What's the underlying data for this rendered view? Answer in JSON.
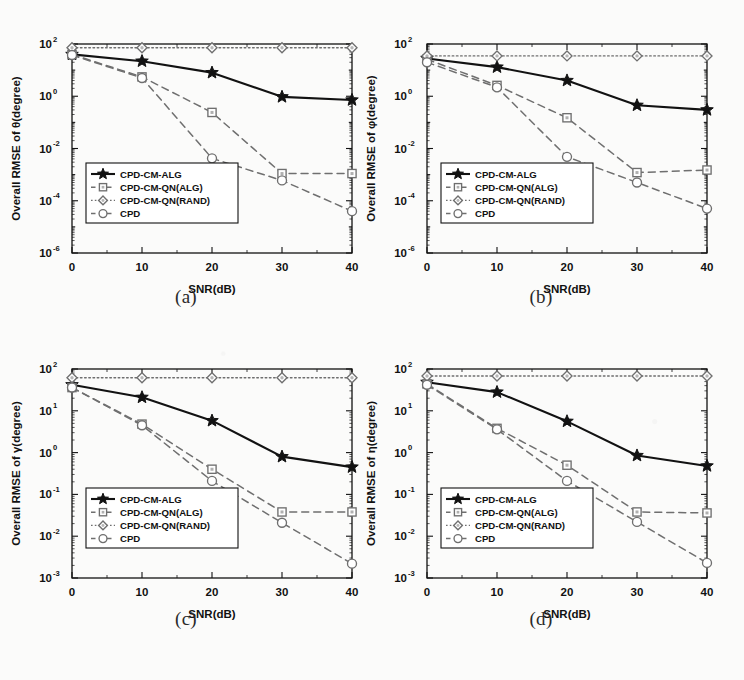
{
  "figure": {
    "xlabel": "SNR(dB)",
    "xticks": [
      "0",
      "10",
      "20",
      "30",
      "40"
    ],
    "legend": [
      {
        "label": "CPD-CM-ALG",
        "marker": "star",
        "line": "solid",
        "color": "#000000"
      },
      {
        "label": "CPD-CM-QN(ALG)",
        "marker": "square",
        "line": "dashed",
        "color": "#6f6f6f"
      },
      {
        "label": "CPD-CM-QN(RAND)",
        "marker": "diamond",
        "line": "dotted",
        "color": "#6f6f6f"
      },
      {
        "label": "CPD",
        "marker": "circle",
        "line": "dashed",
        "color": "#6f6f6f"
      }
    ]
  },
  "chart_data": [
    {
      "type": "line",
      "panel": "a",
      "caption": "(a)",
      "title": "",
      "xlabel": "SNR(dB)",
      "ylabel": "Overall RMSE of θ(degree)",
      "x": [
        0,
        10,
        20,
        30,
        40
      ],
      "xlim": [
        0,
        40
      ],
      "ylim": [
        1e-06,
        100
      ],
      "yscale": "log",
      "ytick_labels": [
        "10⁻⁶",
        "10⁻⁴",
        "10⁻²",
        "10⁰",
        "10²"
      ],
      "ytick_values": [
        1e-06,
        0.0001,
        0.01,
        1,
        100
      ],
      "grid": false,
      "legend_position": "lower-left",
      "series": [
        {
          "name": "CPD-CM-ALG",
          "values": [
            40,
            22,
            8,
            0.95,
            0.72
          ]
        },
        {
          "name": "CPD-CM-QN(ALG)",
          "values": [
            40,
            5.5,
            0.24,
            0.0011,
            0.0011
          ]
        },
        {
          "name": "CPD-CM-QN(RAND)",
          "values": [
            72,
            72,
            72,
            72,
            72
          ]
        },
        {
          "name": "CPD",
          "values": [
            38,
            5.0,
            0.0042,
            0.0006,
            4e-05
          ]
        }
      ]
    },
    {
      "type": "line",
      "panel": "b",
      "caption": "(b)",
      "title": "",
      "xlabel": "SNR(dB)",
      "ylabel": "Overall RMSE of φ(degree)",
      "x": [
        0,
        10,
        20,
        30,
        40
      ],
      "xlim": [
        0,
        40
      ],
      "ylim": [
        1e-06,
        100
      ],
      "yscale": "log",
      "ytick_labels": [
        "10⁻⁶",
        "10⁻⁴",
        "10⁻²",
        "10⁰",
        "10²"
      ],
      "ytick_values": [
        1e-06,
        0.0001,
        0.01,
        1,
        100
      ],
      "grid": false,
      "legend_position": "lower-left",
      "series": [
        {
          "name": "CPD-CM-ALG",
          "values": [
            28,
            13,
            4.0,
            0.45,
            0.3
          ]
        },
        {
          "name": "CPD-CM-QN(ALG)",
          "values": [
            26,
            2.6,
            0.15,
            0.0012,
            0.0015
          ]
        },
        {
          "name": "CPD-CM-QN(RAND)",
          "values": [
            35,
            35,
            35,
            35,
            35
          ]
        },
        {
          "name": "CPD",
          "values": [
            20,
            2.2,
            0.0048,
            0.0005,
            5e-05
          ]
        }
      ]
    },
    {
      "type": "line",
      "panel": "c",
      "caption": "(c)",
      "title": "",
      "xlabel": "SNR(dB)",
      "ylabel": "Overall RMSE of γ(degree)",
      "x": [
        0,
        10,
        20,
        30,
        40
      ],
      "xlim": [
        0,
        40
      ],
      "ylim": [
        0.001,
        100
      ],
      "yscale": "log",
      "ytick_labels": [
        "10⁻³",
        "10⁻²",
        "10⁻¹",
        "10⁰",
        "10¹",
        "10²"
      ],
      "ytick_values": [
        0.001,
        0.01,
        0.1,
        1,
        10,
        100
      ],
      "grid": false,
      "legend_position": "lower-left",
      "series": [
        {
          "name": "CPD-CM-ALG",
          "values": [
            42,
            21,
            5.8,
            0.8,
            0.45
          ]
        },
        {
          "name": "CPD-CM-QN(ALG)",
          "values": [
            36,
            4.8,
            0.4,
            0.038,
            0.038
          ]
        },
        {
          "name": "CPD-CM-QN(RAND)",
          "values": [
            62,
            62,
            62,
            62,
            62
          ]
        },
        {
          "name": "CPD",
          "values": [
            36,
            4.5,
            0.21,
            0.021,
            0.0022
          ]
        }
      ]
    },
    {
      "type": "line",
      "panel": "d",
      "caption": "(d)",
      "title": "",
      "xlabel": "SNR(dB)",
      "ylabel": "Overall RMSE of η(degree)",
      "x": [
        0,
        10,
        20,
        30,
        40
      ],
      "xlim": [
        0,
        40
      ],
      "ylim": [
        0.001,
        100
      ],
      "yscale": "log",
      "ytick_labels": [
        "10⁻³",
        "10⁻²",
        "10⁻¹",
        "10⁰",
        "10¹",
        "10²"
      ],
      "ytick_values": [
        0.001,
        0.01,
        0.1,
        1,
        10,
        100
      ],
      "grid": false,
      "legend_position": "lower-left",
      "series": [
        {
          "name": "CPD-CM-ALG",
          "values": [
            48,
            28,
            5.6,
            0.85,
            0.48
          ]
        },
        {
          "name": "CPD-CM-QN(ALG)",
          "values": [
            44,
            3.8,
            0.5,
            0.038,
            0.036
          ]
        },
        {
          "name": "CPD-CM-QN(RAND)",
          "values": [
            68,
            68,
            68,
            68,
            68
          ]
        },
        {
          "name": "CPD",
          "values": [
            42,
            3.6,
            0.21,
            0.022,
            0.0023
          ]
        }
      ]
    }
  ]
}
